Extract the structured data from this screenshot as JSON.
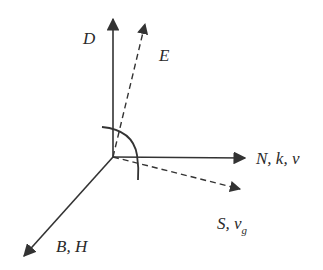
{
  "diagram": {
    "type": "vector-diagram",
    "colors": {
      "stroke": "#333333",
      "background": "#ffffff"
    },
    "origin": [
      113,
      157
    ],
    "vectors": [
      {
        "id": "D",
        "label": "D",
        "style": "solid",
        "tip": [
          113,
          17
        ]
      },
      {
        "id": "E",
        "label": "E",
        "style": "dashed",
        "tip": [
          146,
          22
        ]
      },
      {
        "id": "N",
        "label": "N, k, v",
        "style": "solid",
        "tip": [
          247,
          158
        ]
      },
      {
        "id": "S",
        "label": "S, v",
        "label_subscript": "g",
        "style": "dashed",
        "tip": [
          242,
          190
        ]
      },
      {
        "id": "B",
        "label": "B, H",
        "style": "solid",
        "tip": [
          22,
          258
        ]
      }
    ],
    "labels": {
      "D": "D",
      "E": "E",
      "N": "N, k, v",
      "S_main": "S, v",
      "S_sub": "g",
      "B": "B, H"
    },
    "angle_arc": {
      "description": "right-angle arc spanning D to S direction"
    }
  }
}
